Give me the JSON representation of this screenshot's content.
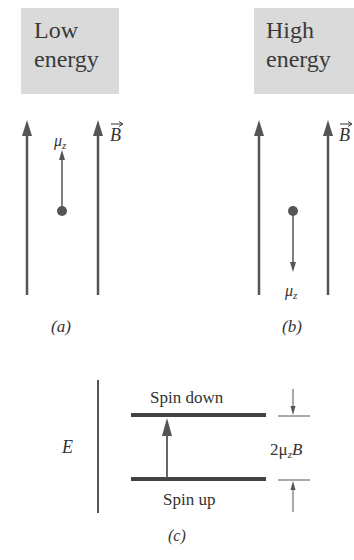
{
  "panels": {
    "a": {
      "state_label_line1": "Low",
      "state_label_line2": "energy",
      "moment_label": "μ",
      "moment_subscript": "z",
      "moment_direction": "up",
      "field_label": "B",
      "caption": "(a)"
    },
    "b": {
      "state_label_line1": "High",
      "state_label_line2": "energy",
      "moment_label": "μ",
      "moment_subscript": "z",
      "moment_direction": "down",
      "field_label": "B",
      "caption": "(b)"
    },
    "c": {
      "axis_label": "E",
      "upper_level_label": "Spin down",
      "lower_level_label": "Spin up",
      "gap_label_prefix": "2μ",
      "gap_label_subscript": "z",
      "gap_label_suffix": "B",
      "caption": "(c)"
    }
  },
  "colors": {
    "line": "#555555",
    "box": "#dadada",
    "text": "#333333"
  }
}
